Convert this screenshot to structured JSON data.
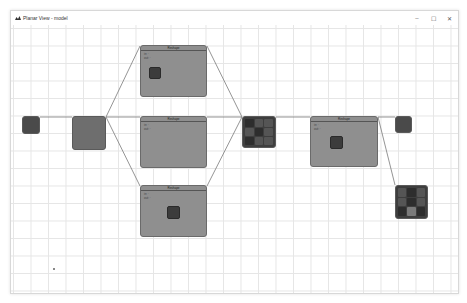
{
  "window": {
    "title": "Planar View - model",
    "controls": {
      "minimize": "–",
      "maximize": "☐",
      "close": "✕"
    }
  },
  "canvas": {
    "grid": true,
    "nodes": [
      {
        "id": "input",
        "kind": "small",
        "label": ""
      },
      {
        "id": "stem",
        "kind": "mid",
        "label": ""
      },
      {
        "id": "branch-top",
        "kind": "big",
        "label": "Reshape",
        "fields": [
          "in: ·",
          "out: ·"
        ]
      },
      {
        "id": "branch-mid",
        "kind": "big",
        "label": "Reshape",
        "fields": [
          "in: ·",
          "out: ·"
        ]
      },
      {
        "id": "branch-bottom",
        "kind": "big",
        "label": "Reshape",
        "fields": [
          "in: ·",
          "out: ·"
        ]
      },
      {
        "id": "merge",
        "kind": "grid",
        "label": ""
      },
      {
        "id": "process",
        "kind": "big",
        "label": "Reshape",
        "fields": [
          "in: ·",
          "out: ·"
        ]
      },
      {
        "id": "output-a",
        "kind": "small",
        "label": ""
      },
      {
        "id": "output-b",
        "kind": "grid",
        "label": ""
      }
    ]
  }
}
